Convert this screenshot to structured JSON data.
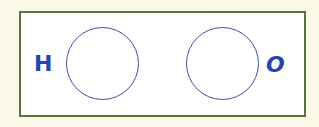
{
  "diagram": {
    "type": "molecule-bonding-template",
    "frame_color": "#4f7a3a",
    "background_color": "#fbf8e8",
    "ink_color": "#2344b5",
    "atoms": [
      {
        "symbol": "H",
        "label_side": "left"
      },
      {
        "symbol": "O",
        "label_side": "right"
      }
    ]
  }
}
